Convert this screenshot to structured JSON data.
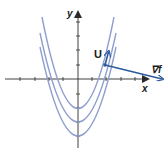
{
  "diagram": {
    "axes": {
      "x_label": "x",
      "y_label": "y",
      "axis_color": "#2a2a2a"
    },
    "curves": {
      "color": "#8e9fd0",
      "count": 3,
      "description": "Three nested upward-opening parabolas (level curves)"
    },
    "vectors": {
      "tangent_label": "U",
      "gradient_label": "∇f",
      "vector_color": "#2d5a9b"
    }
  }
}
